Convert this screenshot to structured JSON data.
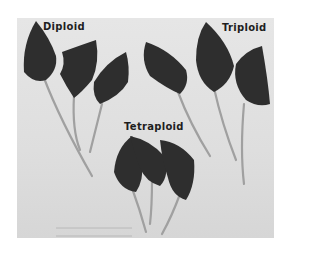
{
  "figure": {
    "labels": {
      "diploid": "Diploid",
      "triploid": "Triploid",
      "tetraploid": "Tetraploid"
    },
    "groups": [
      {
        "name": "Diploid",
        "leaf_count": 3
      },
      {
        "name": "Triploid",
        "leaf_count": 3
      },
      {
        "name": "Tetraploid",
        "leaf_count": 3
      }
    ],
    "colors": {
      "background": "#ffffff",
      "backdrop": "#e0e0e0",
      "leaf": "#2e2e2e",
      "petiole": "#9a9a9a",
      "text": "#1e1e1e"
    }
  }
}
